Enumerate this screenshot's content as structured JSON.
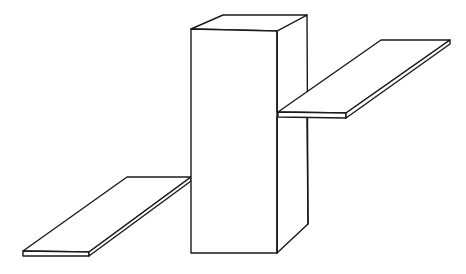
{
  "figure": {
    "colors": {
      "stroke": "#1a1a1a",
      "background": "#ffffff"
    },
    "shapes": {
      "box": {
        "label": "box"
      },
      "plank_right": {
        "label": "upper-right plank"
      },
      "plank_left": {
        "label": "lower-left plank"
      }
    }
  }
}
